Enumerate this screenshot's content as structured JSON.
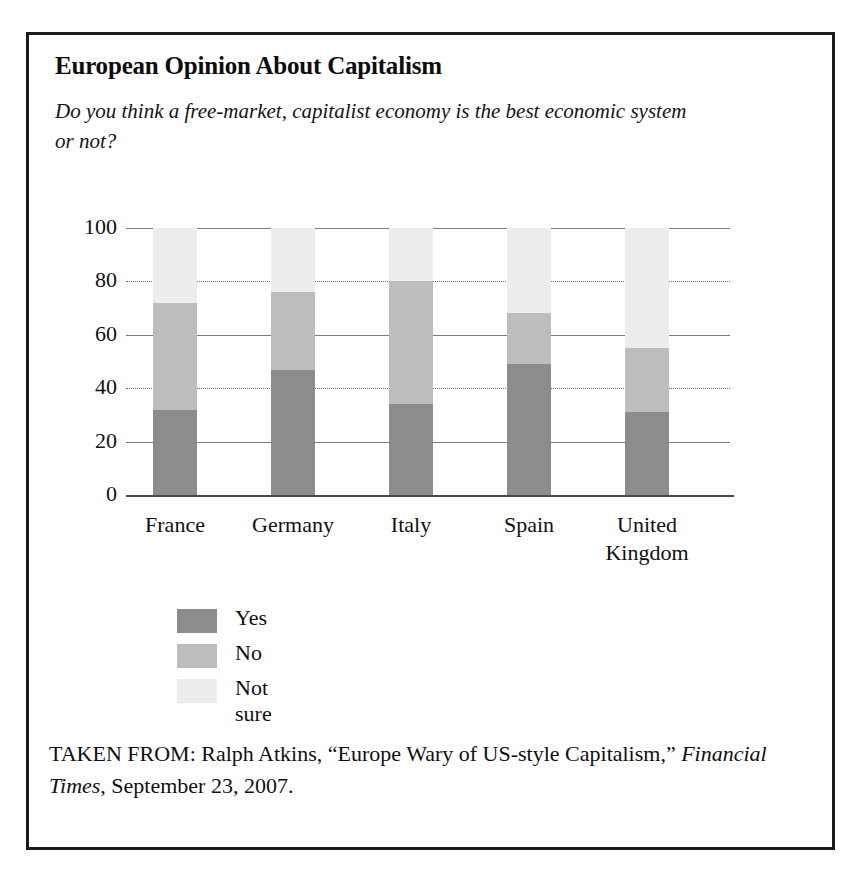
{
  "figure": {
    "title": "European Opinion About Capitalism",
    "subtitle": "Do you think a free-market, capitalist economy is the best economic system or not?",
    "source_prefix": "TAKEN FROM: Ralph Atkins, “Europe Wary of US-style Capitalism,” ",
    "source_publication": "Financial Times",
    "source_suffix": ", September 23, 2007."
  },
  "colors": {
    "yes": "#8c8c8c",
    "no": "#bdbdbd",
    "not_sure": "#ededed",
    "frame": "#1c1c1c",
    "axis": "#4a4a4a",
    "grid": "#7b7b7b"
  },
  "chart_data": {
    "type": "bar",
    "stacked": true,
    "title": "European Opinion About Capitalism",
    "subtitle": "Do you think a free-market, capitalist economy is the best economic system or not?",
    "xlabel": "",
    "ylabel": "",
    "ylim": [
      0,
      100
    ],
    "yticks": [
      0,
      20,
      40,
      60,
      80,
      100
    ],
    "ytick_labels": [
      "0",
      "20",
      "40",
      "60",
      "80",
      "100"
    ],
    "grid": true,
    "legend_position": "below-left",
    "categories": [
      "France",
      "Germany",
      "Italy",
      "Spain",
      "United Kingdom"
    ],
    "category_lines": [
      [
        "France"
      ],
      [
        "Germany"
      ],
      [
        "Italy"
      ],
      [
        "Spain"
      ],
      [
        "United",
        "Kingdom"
      ]
    ],
    "series": [
      {
        "name": "Yes",
        "color": "#8c8c8c",
        "values": [
          32,
          47,
          34,
          49,
          31
        ]
      },
      {
        "name": "No",
        "color": "#bdbdbd",
        "values": [
          40,
          29,
          46,
          19,
          24
        ]
      },
      {
        "name": "Not sure",
        "color": "#ededed",
        "values": [
          28,
          24,
          20,
          32,
          45
        ]
      }
    ],
    "cumulative_tops": {
      "Yes": [
        32,
        47,
        34,
        49,
        31
      ],
      "No": [
        72,
        76,
        80,
        68,
        55
      ],
      "Not sure": [
        100,
        100,
        100,
        100,
        100
      ]
    }
  }
}
